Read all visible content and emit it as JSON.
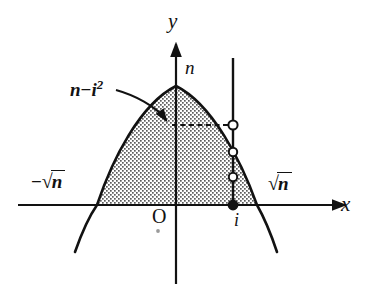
{
  "figure": {
    "kind": "math-diagram",
    "background_color": "#ffffff",
    "ink_color": "#121212"
  },
  "axes": {
    "x_axis_label": "x",
    "y_axis_label": "y",
    "origin_label": "O",
    "x_axis": {
      "y_px": 205,
      "x_start_px": 18,
      "x_end_px": 352
    },
    "y_axis": {
      "x_px": 176,
      "y_top_px": 38,
      "y_bottom_px": 284
    }
  },
  "curve": {
    "type": "parabola",
    "equation": "y = n - x^2",
    "apex_label": "n",
    "apex_px": {
      "x": 176,
      "y": 86
    },
    "left_root_label": "-√n",
    "right_root_label": "√n",
    "left_root_px": {
      "x": 97,
      "y": 205
    },
    "right_root_px": {
      "x": 257,
      "y": 205
    },
    "fill": "stipple-dots",
    "stroke_width": 2.4
  },
  "labels": {
    "height_label_text": "n - i²",
    "height_label_n": "n",
    "height_label_minus": "−",
    "height_label_i": "i",
    "height_label_exp": "2",
    "sqrt_symbol": "√",
    "sqrt_radicand": "n",
    "minus_sign": "−",
    "column_label": "i",
    "apex_value_label": "n"
  },
  "annotation": {
    "curved_arrow": {
      "from_px": {
        "x": 118,
        "y": 92
      },
      "to_px": {
        "x": 168,
        "y": 122
      },
      "description": "curved arrow from the n - i squared label to the dashed height line"
    },
    "dashed_line": {
      "y_px": 125,
      "x_start_px": 172,
      "x_end_px": 233,
      "description": "dashed horizontal segment at height n - i squared"
    }
  },
  "column": {
    "x_label": "i",
    "line_x_px": 233,
    "line_top_px": 58,
    "line_bottom_px": 207,
    "points": [
      {
        "style": "open",
        "y_px": 125,
        "note": "intersection with parabola at height n - i^2"
      },
      {
        "style": "open",
        "y_px": 152,
        "note": "lattice point"
      },
      {
        "style": "open",
        "y_px": 177,
        "note": "lattice point"
      },
      {
        "style": "filled",
        "y_px": 205,
        "note": "point on the x-axis at x = i"
      }
    ]
  }
}
